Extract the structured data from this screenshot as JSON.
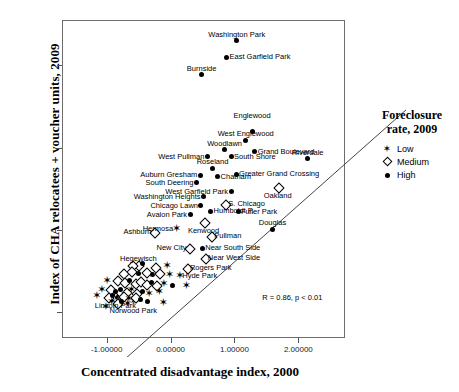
{
  "chart_data": {
    "type": "scatter",
    "title": "",
    "xlabel": "Concentrated disadvantage index, 2000",
    "ylabel": "Index of CHA relocatees + voucher units, 2009",
    "xlim": [
      -1.7,
      2.73
    ],
    "ylim": [
      -2.62,
      5.1
    ],
    "xticks": [
      "-1.00000",
      "0.00000",
      "1.00000",
      "2.00000"
    ],
    "xtick_values": [
      -1,
      0,
      1,
      2
    ],
    "yticks": [
      "4.00",
      "2.00",
      "0.00",
      "-2.00"
    ],
    "ytick_values": [
      4,
      2,
      0,
      -2
    ],
    "grid": false,
    "annotation": "R = 0.86, p < 0.01",
    "regression": {
      "x0": -1.7,
      "y0": -2.62,
      "x1": 2.73,
      "y1": 3.47
    },
    "legend": {
      "position": "right",
      "title_line1": "Foreclosure",
      "title_line2": "rate, 2009",
      "entries": [
        {
          "label": "Low",
          "symbol": "star"
        },
        {
          "label": "Medium",
          "symbol": "diamond"
        },
        {
          "label": "High",
          "symbol": "circle"
        }
      ]
    },
    "points": [
      {
        "name": "Washington Park",
        "x": 1.02,
        "y": 4.62,
        "group": "High",
        "label_pos": "above"
      },
      {
        "name": "East Garfield Park",
        "x": 0.86,
        "y": 4.22,
        "group": "High",
        "label_pos": "right"
      },
      {
        "name": "Burnside",
        "x": 0.47,
        "y": 3.79,
        "group": "High",
        "label_pos": "above"
      },
      {
        "name": "Englewood",
        "x": 1.26,
        "y": 2.42,
        "group": "High",
        "label_pos": "above2"
      },
      {
        "name": "West Englewood",
        "x": 1.16,
        "y": 2.2,
        "group": "High",
        "label_pos": "above"
      },
      {
        "name": "Woodlawn",
        "x": 0.83,
        "y": 1.98,
        "group": "High",
        "label_pos": "above"
      },
      {
        "name": "Grand Boulevard",
        "x": 1.3,
        "y": 1.93,
        "group": "High",
        "label_pos": "right"
      },
      {
        "name": "Riverdale",
        "x": 2.13,
        "y": 1.76,
        "group": "High",
        "label_pos": "above"
      },
      {
        "name": "West Pullman",
        "x": 0.56,
        "y": 1.8,
        "group": "High",
        "label_pos": "left"
      },
      {
        "name": "South Shore",
        "x": 0.93,
        "y": 1.8,
        "group": "High",
        "label_pos": "right"
      },
      {
        "name": "Roseland",
        "x": 0.64,
        "y": 1.52,
        "group": "High",
        "label_pos": "above"
      },
      {
        "name": "Auburn Gresham",
        "x": 0.45,
        "y": 1.35,
        "group": "High",
        "label_pos": "left"
      },
      {
        "name": "Chatham",
        "x": 0.72,
        "y": 1.32,
        "group": "High",
        "label_pos": "right"
      },
      {
        "name": "Greater Grand Crossing",
        "x": 1.01,
        "y": 1.38,
        "group": "High",
        "label_pos": "right"
      },
      {
        "name": "South Deering",
        "x": 0.39,
        "y": 1.17,
        "group": "High",
        "label_pos": "left"
      },
      {
        "name": "Oakland",
        "x": 1.66,
        "y": 1.08,
        "group": "Medium",
        "label_pos": "below"
      },
      {
        "name": "West Garfield Park",
        "x": 0.93,
        "y": 0.96,
        "group": "High",
        "label_pos": "left"
      },
      {
        "name": "Washington Heights",
        "x": 0.5,
        "y": 0.83,
        "group": "High",
        "label_pos": "left"
      },
      {
        "name": "S. Chicago",
        "x": 0.84,
        "y": 0.66,
        "group": "Medium",
        "label_pos": "right"
      },
      {
        "name": "Chicago Lawn",
        "x": 0.46,
        "y": 0.62,
        "group": "High",
        "label_pos": "left"
      },
      {
        "name": "Humboldt P.",
        "x": 0.61,
        "y": 0.48,
        "group": "High",
        "label_pos": "right"
      },
      {
        "name": "Fuller Park",
        "x": 1.04,
        "y": 0.47,
        "group": "High",
        "label_pos": "right"
      },
      {
        "name": "Avalon Park",
        "x": 0.29,
        "y": 0.4,
        "group": "High",
        "label_pos": "left"
      },
      {
        "name": "Kenwood",
        "x": 0.5,
        "y": 0.22,
        "group": "Medium",
        "label_pos": "below"
      },
      {
        "name": "Douglas",
        "x": 1.58,
        "y": 0.04,
        "group": "High",
        "label_pos": "above"
      },
      {
        "name": "Hermosa",
        "x": 0.07,
        "y": 0.06,
        "group": "Low",
        "label_pos": "left"
      },
      {
        "name": "Ashburn",
        "x": -0.27,
        "y": -0.03,
        "group": "Medium",
        "label_pos": "left"
      },
      {
        "name": "Pullman",
        "x": 0.62,
        "y": -0.12,
        "group": "Medium",
        "label_pos": "right"
      },
      {
        "name": "Near South Side",
        "x": 0.48,
        "y": -0.42,
        "group": "High",
        "label_pos": "right"
      },
      {
        "name": "New City",
        "x": 0.28,
        "y": -0.4,
        "group": "Medium",
        "label_pos": "left"
      },
      {
        "name": "Near West Side",
        "x": 0.52,
        "y": -0.66,
        "group": "Medium",
        "label_pos": "right"
      },
      {
        "name": "Rogers Park",
        "x": 0.24,
        "y": -0.9,
        "group": "Medium",
        "label_pos": "right"
      },
      {
        "name": "Hegewisch",
        "x": -0.52,
        "y": -0.82,
        "group": "Medium",
        "label_pos": "above"
      },
      {
        "name": "Hyde Park",
        "x": 0.12,
        "y": -1.08,
        "group": "Low",
        "label_pos": "right"
      },
      {
        "name": "Lincoln Park",
        "x": -0.88,
        "y": -1.6,
        "group": "Medium",
        "label_pos": "below"
      },
      {
        "name": "Norwood Park",
        "x": -0.6,
        "y": -1.72,
        "group": "Low",
        "label_pos": "below"
      },
      {
        "name": "",
        "x": -0.62,
        "y": -0.82,
        "group": "Medium"
      },
      {
        "name": "",
        "x": -0.45,
        "y": -0.78,
        "group": "High"
      },
      {
        "name": "",
        "x": -0.26,
        "y": -0.86,
        "group": "Medium"
      },
      {
        "name": "",
        "x": -0.08,
        "y": -0.84,
        "group": "Low"
      },
      {
        "name": "",
        "x": -0.76,
        "y": -1.02,
        "group": "Medium"
      },
      {
        "name": "",
        "x": -0.64,
        "y": -0.98,
        "group": "Medium"
      },
      {
        "name": "",
        "x": -0.52,
        "y": -1.04,
        "group": "High"
      },
      {
        "name": "",
        "x": -0.4,
        "y": -1.0,
        "group": "Medium"
      },
      {
        "name": "",
        "x": -0.3,
        "y": -1.06,
        "group": "High"
      },
      {
        "name": "",
        "x": -0.19,
        "y": -1.02,
        "group": "Medium"
      },
      {
        "name": "",
        "x": -0.04,
        "y": -1.06,
        "group": "Low"
      },
      {
        "name": "",
        "x": -1.02,
        "y": -1.22,
        "group": "Low"
      },
      {
        "name": "",
        "x": -0.86,
        "y": -1.18,
        "group": "Medium"
      },
      {
        "name": "",
        "x": -0.74,
        "y": -1.24,
        "group": "Medium"
      },
      {
        "name": "",
        "x": -0.66,
        "y": -1.2,
        "group": "High"
      },
      {
        "name": "",
        "x": -0.58,
        "y": -1.26,
        "group": "Medium"
      },
      {
        "name": "",
        "x": -0.5,
        "y": -1.22,
        "group": "Medium"
      },
      {
        "name": "",
        "x": -0.4,
        "y": -1.28,
        "group": "Medium"
      },
      {
        "name": "",
        "x": -0.32,
        "y": -1.24,
        "group": "High"
      },
      {
        "name": "",
        "x": -0.24,
        "y": -1.3,
        "group": "Medium"
      },
      {
        "name": "",
        "x": -0.13,
        "y": -1.28,
        "group": "Low"
      },
      {
        "name": "",
        "x": 0.02,
        "y": -1.32,
        "group": "High"
      },
      {
        "name": "",
        "x": 0.22,
        "y": -1.34,
        "group": "Low"
      },
      {
        "name": "",
        "x": -1.1,
        "y": -1.44,
        "group": "Low"
      },
      {
        "name": "",
        "x": -0.96,
        "y": -1.4,
        "group": "Medium"
      },
      {
        "name": "",
        "x": -0.88,
        "y": -1.46,
        "group": "High"
      },
      {
        "name": "",
        "x": -0.8,
        "y": -1.42,
        "group": "High"
      },
      {
        "name": "",
        "x": -0.72,
        "y": -1.48,
        "group": "Medium"
      },
      {
        "name": "",
        "x": -0.64,
        "y": -1.44,
        "group": "Low"
      },
      {
        "name": "",
        "x": -0.56,
        "y": -1.5,
        "group": "Medium"
      },
      {
        "name": "",
        "x": -0.46,
        "y": -1.46,
        "group": "High"
      },
      {
        "name": "",
        "x": -0.36,
        "y": -1.52,
        "group": "Low"
      },
      {
        "name": "",
        "x": -0.2,
        "y": -1.48,
        "group": "Low"
      },
      {
        "name": "",
        "x": -1.18,
        "y": -1.58,
        "group": "Low"
      },
      {
        "name": "",
        "x": -1.0,
        "y": -1.6,
        "group": "Medium"
      },
      {
        "name": "",
        "x": -0.92,
        "y": -1.56,
        "group": "High"
      },
      {
        "name": "",
        "x": -0.84,
        "y": -1.62,
        "group": "High"
      },
      {
        "name": "",
        "x": -0.76,
        "y": -1.58,
        "group": "Medium"
      },
      {
        "name": "",
        "x": -0.68,
        "y": -1.64,
        "group": "Low"
      },
      {
        "name": "",
        "x": -0.58,
        "y": -1.6,
        "group": "Medium"
      },
      {
        "name": "",
        "x": -0.48,
        "y": -1.66,
        "group": "High"
      },
      {
        "name": "",
        "x": -0.95,
        "y": -1.72,
        "group": "Low"
      },
      {
        "name": "",
        "x": -0.86,
        "y": -1.74,
        "group": "Medium"
      },
      {
        "name": "",
        "x": -0.78,
        "y": -1.7,
        "group": "High"
      },
      {
        "name": "",
        "x": -0.7,
        "y": -1.76,
        "group": "Low"
      },
      {
        "name": "",
        "x": -0.38,
        "y": -1.7,
        "group": "High"
      },
      {
        "name": "",
        "x": -0.14,
        "y": -1.74,
        "group": "Low"
      },
      {
        "name": "",
        "x": -1.04,
        "y": -1.84,
        "group": "Low"
      }
    ]
  }
}
